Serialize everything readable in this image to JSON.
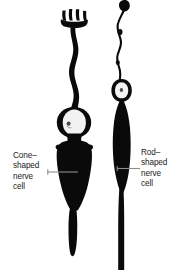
{
  "figure": {
    "background_color": "#ffffff",
    "ink_color": "#0a0a0a",
    "leader_color": "#8c8c8c",
    "nucleus_fill": "#f2f2f2",
    "nucleolus_color": "#3a3a3a"
  },
  "labels": {
    "cone": {
      "name": "cone-shaped-nerve-cell-label",
      "lines": [
        "Cone–",
        "shaped",
        "nerve",
        "cell"
      ],
      "line1": "Cone–",
      "line2": "shaped",
      "line3": "nerve",
      "line4": "cell",
      "leader_from": "text",
      "leader_to": "cone-cell-body"
    },
    "rod": {
      "name": "rod-shaped-nerve-cell-label",
      "lines": [
        "Rod–",
        "shaped",
        "nerve",
        "cell"
      ],
      "line1": "Rod–",
      "line2": "shaped",
      "line3": "nerve",
      "line4": "cell",
      "leader_from": "text",
      "leader_to": "rod-cell-body"
    }
  },
  "cells": {
    "cone": {
      "name": "cone-shaped-nerve-cell",
      "parts": [
        "outer-segment-fingers",
        "inner-segment",
        "nucleus",
        "cell-body",
        "axon"
      ],
      "finger_count": 4
    },
    "rod": {
      "name": "rod-shaped-nerve-cell",
      "parts": [
        "outer-segment-filament",
        "terminal-bulb",
        "nucleus",
        "cell-body",
        "axon"
      ],
      "finger_count": 0
    }
  }
}
